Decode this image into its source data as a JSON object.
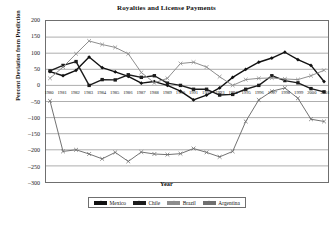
{
  "chart_data": {
    "type": "line",
    "title": "Royalties and License Payments",
    "xlabel": "Year",
    "ylabel": "Percent Deviation from Prediction",
    "ylim": [
      -300,
      200
    ],
    "yticks": [
      200,
      150,
      100,
      50,
      0,
      -50,
      -100,
      -150,
      -200,
      -250,
      -300
    ],
    "grid": true,
    "legend_position": "bottom-center",
    "categories": [
      "1980",
      "1981",
      "1982",
      "1983",
      "1984",
      "1985",
      "1986",
      "1987",
      "1988",
      "1989",
      "1990",
      "1991",
      "1992",
      "1993",
      "1994",
      "1995",
      "1996",
      "1997",
      "1998",
      "1999",
      "2000",
      "2001"
    ],
    "series": [
      {
        "name": "Mexico",
        "color": "#111111",
        "marker": "diamond",
        "values": [
          43,
          30,
          47,
          88,
          55,
          42,
          28,
          7,
          12,
          0,
          -18,
          -45,
          -30,
          -8,
          25,
          50,
          72,
          85,
          103,
          80,
          62,
          12
        ]
      },
      {
        "name": "Chile",
        "color": "#1c1c1c",
        "marker": "square",
        "values": [
          45,
          62,
          74,
          0,
          18,
          17,
          33,
          25,
          30,
          7,
          0,
          -12,
          -12,
          -30,
          -28,
          -12,
          0,
          30,
          15,
          8,
          -10,
          -20
        ]
      },
      {
        "name": "Brazil",
        "color": "#8d8d8d",
        "marker": "x",
        "values": [
          22,
          57,
          98,
          138,
          127,
          118,
          98,
          40,
          8,
          22,
          68,
          72,
          57,
          27,
          0,
          18,
          22,
          23,
          20,
          18,
          30,
          47
        ]
      },
      {
        "name": "Argentina",
        "color": "#707070",
        "marker": "x",
        "values": [
          -48,
          -205,
          -200,
          -213,
          -228,
          -208,
          -236,
          -207,
          -213,
          -215,
          -212,
          -196,
          -208,
          -222,
          -205,
          -112,
          -45,
          -18,
          -8,
          -40,
          -105,
          -112
        ]
      }
    ]
  }
}
